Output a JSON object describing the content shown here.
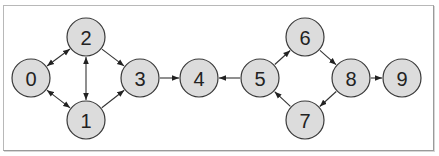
{
  "diagram": {
    "type": "directed-graph",
    "node_radius": 19,
    "colors": {
      "node_fill": "#dcdcdc",
      "node_stroke": "#3a3a3a",
      "edge": "#333333",
      "frame": "#b0b0b0"
    },
    "nodes": [
      {
        "id": "0",
        "label": "0",
        "x": 31,
        "y": 78
      },
      {
        "id": "1",
        "label": "1",
        "x": 86,
        "y": 120
      },
      {
        "id": "2",
        "label": "2",
        "x": 86,
        "y": 37
      },
      {
        "id": "3",
        "label": "3",
        "x": 140,
        "y": 78
      },
      {
        "id": "4",
        "label": "4",
        "x": 199,
        "y": 78
      },
      {
        "id": "5",
        "label": "5",
        "x": 260,
        "y": 78
      },
      {
        "id": "6",
        "label": "6",
        "x": 305,
        "y": 37
      },
      {
        "id": "7",
        "label": "7",
        "x": 305,
        "y": 120
      },
      {
        "id": "8",
        "label": "8",
        "x": 351,
        "y": 78
      },
      {
        "id": "9",
        "label": "9",
        "x": 402,
        "y": 78
      }
    ],
    "edges": [
      {
        "from": "0",
        "to": "2",
        "bidirectional": true
      },
      {
        "from": "0",
        "to": "1",
        "bidirectional": true
      },
      {
        "from": "1",
        "to": "2",
        "bidirectional": true
      },
      {
        "from": "2",
        "to": "3",
        "bidirectional": false
      },
      {
        "from": "1",
        "to": "3",
        "bidirectional": false
      },
      {
        "from": "3",
        "to": "4",
        "bidirectional": false
      },
      {
        "from": "5",
        "to": "4",
        "bidirectional": false
      },
      {
        "from": "5",
        "to": "6",
        "bidirectional": false
      },
      {
        "from": "6",
        "to": "8",
        "bidirectional": false
      },
      {
        "from": "8",
        "to": "9",
        "bidirectional": false
      },
      {
        "from": "8",
        "to": "7",
        "bidirectional": false
      },
      {
        "from": "7",
        "to": "5",
        "bidirectional": false
      }
    ]
  }
}
